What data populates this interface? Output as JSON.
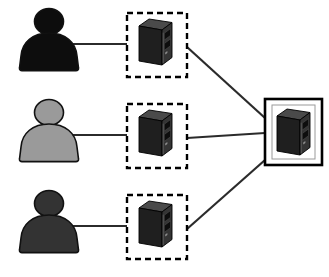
{
  "diagram": {
    "canvas": {
      "width": 329,
      "height": 277,
      "background": "#ffffff"
    },
    "colors": {
      "person_black": "#0d0d0d",
      "person_gray": "#9a9a9a",
      "person_dark_gray": "#333333",
      "person_outline": "#111111",
      "server_body_dark": "#2b2b2b",
      "server_body_mid": "#3d3d3d",
      "server_top": "#4a4a4a",
      "server_side": "#1c1c1c",
      "server_outline": "#000000",
      "dashed_border": "#000000",
      "solid_border": "#000000",
      "inner_frame": "#9a9a9a",
      "connector_line": "#2b2b2b"
    },
    "nodes": [
      {
        "id": "client-1",
        "type": "person",
        "label": "",
        "fill_key": "person_black",
        "x": 14,
        "y": 8,
        "width": 70,
        "height": 62
      },
      {
        "id": "client-2",
        "type": "person",
        "label": "",
        "fill_key": "person_gray",
        "x": 14,
        "y": 99,
        "width": 70,
        "height": 62
      },
      {
        "id": "client-3",
        "type": "person",
        "label": "",
        "fill_key": "person_dark_gray",
        "x": 14,
        "y": 190,
        "width": 70,
        "height": 62
      },
      {
        "id": "edge-server-1",
        "type": "server-in-dashed-box",
        "label": "",
        "box": {
          "x": 127,
          "y": 13,
          "width": 60,
          "height": 64
        },
        "tower": {
          "x": 139,
          "y": 19,
          "width": 33,
          "height": 46
        }
      },
      {
        "id": "edge-server-2",
        "type": "server-in-dashed-box",
        "label": "",
        "box": {
          "x": 127,
          "y": 104,
          "width": 60,
          "height": 64
        },
        "tower": {
          "x": 139,
          "y": 110,
          "width": 33,
          "height": 46
        }
      },
      {
        "id": "edge-server-3",
        "type": "server-in-dashed-box",
        "label": "",
        "box": {
          "x": 127,
          "y": 195,
          "width": 60,
          "height": 64
        },
        "tower": {
          "x": 139,
          "y": 201,
          "width": 33,
          "height": 46
        }
      },
      {
        "id": "central-server",
        "type": "server-in-solid-box",
        "label": "",
        "box": {
          "x": 265,
          "y": 99,
          "width": 57,
          "height": 66
        },
        "inner_frame": {
          "x": 272,
          "y": 105,
          "width": 43,
          "height": 54
        },
        "tower": {
          "x": 277,
          "y": 109,
          "width": 33,
          "height": 46
        }
      }
    ],
    "edges": [
      {
        "id": "link-client1-server1",
        "from": "client-1",
        "to": "edge-server-1",
        "style": "solid",
        "x1": 73,
        "y1": 44,
        "x2": 127,
        "y2": 44
      },
      {
        "id": "link-client2-server2",
        "from": "client-2",
        "to": "edge-server-2",
        "style": "solid",
        "x1": 73,
        "y1": 135,
        "x2": 127,
        "y2": 135
      },
      {
        "id": "link-client3-server3",
        "from": "client-3",
        "to": "edge-server-3",
        "style": "solid",
        "x1": 73,
        "y1": 226,
        "x2": 127,
        "y2": 226
      },
      {
        "id": "link-server1-central",
        "from": "edge-server-1",
        "to": "central-server",
        "style": "solid",
        "x1": 187,
        "y1": 47,
        "x2": 265,
        "y2": 118
      },
      {
        "id": "link-server2-central",
        "from": "edge-server-2",
        "to": "central-server",
        "style": "solid",
        "x1": 187,
        "y1": 138,
        "x2": 265,
        "y2": 133
      },
      {
        "id": "link-server3-central",
        "from": "edge-server-3",
        "to": "central-server",
        "style": "solid",
        "x1": 187,
        "y1": 229,
        "x2": 265,
        "y2": 160
      }
    ]
  }
}
